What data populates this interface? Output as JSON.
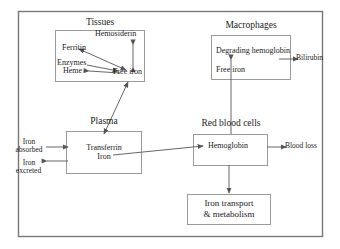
{
  "figure": {
    "kind": "flow-diagram",
    "line_color": "#555555",
    "text_color": "#1a1a1a",
    "background": "#ffffff"
  },
  "compartments": {
    "tissues": {
      "title": "Tissues",
      "items": {
        "hemosiderin": "Hemosiderin",
        "ferritin": "Ferritin",
        "enzymes": "Enzymes",
        "heme": "Heme",
        "free_iron": "Free iron"
      }
    },
    "macrophages": {
      "title": "Macrophages",
      "items": {
        "degrading_hemoglobin": "Degrading hemoglobin",
        "free_iron": "Free iron"
      }
    },
    "plasma": {
      "title": "Plasma",
      "items": {
        "transferrin_iron_line1": "Transferrin",
        "transferrin_iron_line2": "Iron"
      }
    },
    "red_blood_cells": {
      "title": "Red blood cells",
      "items": {
        "hemoglobin": "Hemoglobin"
      }
    },
    "iron_transport": {
      "line1": "Iron transport",
      "line2": "& metabolism"
    }
  },
  "external_labels": {
    "iron_absorbed_line1": "Iron",
    "iron_absorbed_line2": "absorbed",
    "iron_excreted_line1": "Iron",
    "iron_excreted_line2": "excreted",
    "bilirubin": "Bilirubin",
    "blood_loss": "Blood loss"
  },
  "connections": [
    {
      "from": "free-iron-tissues",
      "to": "ferritin",
      "style": "double-headed"
    },
    {
      "from": "free-iron-tissues",
      "to": "hemosiderin",
      "style": "double-headed"
    },
    {
      "from": "free-iron-tissues",
      "to": "heme",
      "style": "single"
    },
    {
      "from": "enzymes",
      "to": "free-iron-tissues",
      "style": "single"
    },
    {
      "from": "free-iron-tissues",
      "to": "transferrin-iron",
      "style": "double-headed"
    },
    {
      "from": "iron-absorbed",
      "to": "transferrin-iron",
      "style": "single"
    },
    {
      "from": "transferrin-iron",
      "to": "iron-excreted",
      "style": "single"
    },
    {
      "from": "transferrin-iron",
      "to": "hemoglobin",
      "style": "single"
    },
    {
      "from": "hemoglobin",
      "to": "blood-loss",
      "style": "single"
    },
    {
      "from": "red-blood-cells",
      "to": "degrading-hemoglobin",
      "style": "single"
    },
    {
      "from": "degrading-hemoglobin",
      "to": "bilirubin",
      "style": "single"
    },
    {
      "from": "hemoglobin",
      "to": "iron-transport",
      "style": "single"
    }
  ]
}
